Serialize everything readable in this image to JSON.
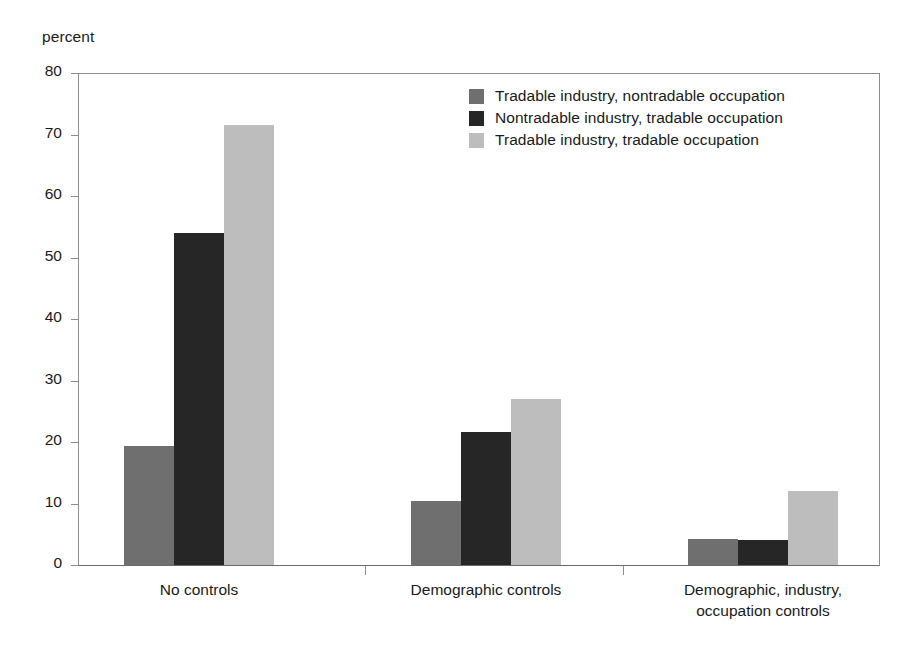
{
  "chart_data": {
    "type": "bar",
    "title": "",
    "xlabel": "",
    "ylabel": "percent",
    "ylim": [
      0,
      80
    ],
    "yticks": [
      0,
      10,
      20,
      30,
      40,
      50,
      60,
      70,
      80
    ],
    "grid": false,
    "legend_position": "top-right",
    "categories": [
      "No controls",
      "Demographic controls",
      "Demographic, industry,\noccupation controls"
    ],
    "categories_lines": [
      [
        "No controls"
      ],
      [
        "Demographic controls"
      ],
      [
        "Demographic, industry,",
        "occupation controls"
      ]
    ],
    "series": [
      {
        "name": "Tradable industry, nontradable occupation",
        "color": "#706F6F",
        "values": [
          19.3,
          10.4,
          4.3
        ]
      },
      {
        "name": "Nontradable industry, tradable occupation",
        "color": "#262626",
        "values": [
          54.0,
          21.7,
          4.0
        ]
      },
      {
        "name": "Tradable industry, tradable occupation",
        "color": "#BDBDBD",
        "values": [
          71.5,
          27.0,
          12.0
        ]
      }
    ]
  },
  "axis": {
    "y_label_text": "percent",
    "tick_labels": [
      "80",
      "70",
      "60",
      "50",
      "40",
      "30",
      "20",
      "10",
      "0"
    ]
  },
  "legend": {
    "items": [
      {
        "label": "Tradable industry, nontradable occupation",
        "swatch": "series-0-swatch"
      },
      {
        "label": "Nontradable industry, tradable occupation",
        "swatch": "series-1-swatch"
      },
      {
        "label": "Tradable industry, tradable occupation",
        "swatch": "series-2-swatch"
      }
    ]
  },
  "colors": {
    "series_0": "#706F6F",
    "series_1": "#262626",
    "series_2": "#BDBDBD",
    "axis_line": "#8D8D8D",
    "text": "#1A1A1A",
    "background": "#FFFFFF"
  }
}
